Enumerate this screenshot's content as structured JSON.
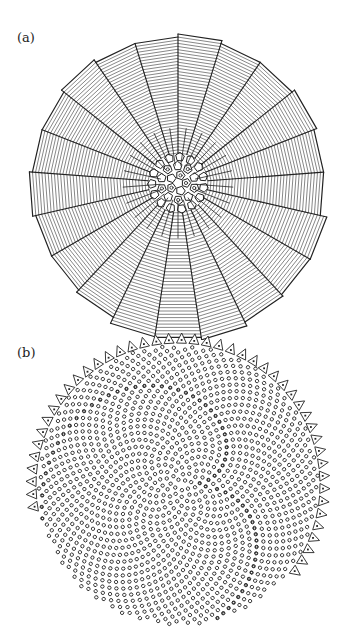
{
  "figure": {
    "panels": [
      {
        "id": "a",
        "label": "(a)",
        "description": "Radial sector tiling with polygonal central cells",
        "center": [
          178,
          183
        ],
        "radius": 150,
        "sectors": 21,
        "rings": 38,
        "core_radius": 30,
        "stroke_color": "#222222"
      },
      {
        "id": "b",
        "label": "(b)",
        "description": "Phyllotactic spiral cell pattern with triangular marginal teeth",
        "center": [
          178,
          485
        ],
        "radius": 140,
        "cell_count": 1400,
        "divergence_angle_deg": 137.508,
        "tooth_count": 46,
        "stroke_color": "#222222"
      }
    ]
  }
}
